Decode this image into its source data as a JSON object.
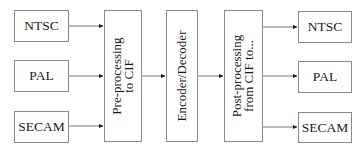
{
  "diagram": {
    "inputs": [
      {
        "label": "NTSC"
      },
      {
        "label": "PAL"
      },
      {
        "label": "SECAM"
      }
    ],
    "stages": [
      {
        "line1": "Pre-processing",
        "line2": "to CIF"
      },
      {
        "line1": "Encoder/Decoder",
        "line2": ""
      },
      {
        "line1": "Post-processing",
        "line2": "from CIF to..."
      }
    ],
    "outputs": [
      {
        "label": "NTSC"
      },
      {
        "label": "PAL"
      },
      {
        "label": "SECAM"
      }
    ],
    "colors": {
      "border": "#8a8a8a",
      "line": "#555555",
      "text": "#1a1a1a"
    }
  }
}
